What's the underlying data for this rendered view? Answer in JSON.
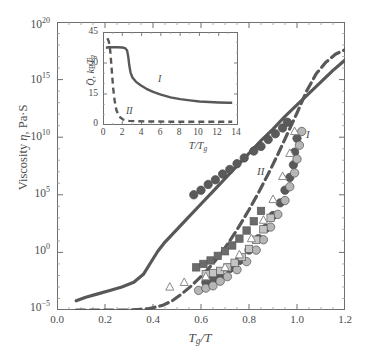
{
  "chart_data": {
    "type": "scatter",
    "title": "",
    "xlabel": "Tg/T",
    "ylabel": "Viscosity n, Pa S",
    "xlim": [
      0.0,
      1.2
    ],
    "ylim_log10": [
      -5,
      20
    ],
    "grid": false,
    "x_ticks": [
      "0.0",
      "0.2",
      "0.4",
      "0.6",
      "0.8",
      "1.0",
      "1.2"
    ],
    "x_tick_values": [
      0.0,
      0.2,
      0.4,
      0.6,
      0.8,
      1.0,
      1.2
    ],
    "y_ticks": [
      "10-5",
      "100",
      "105",
      "1010",
      "1015",
      "1020"
    ],
    "y_tick_exponents": [
      -5,
      0,
      5,
      10,
      15,
      20
    ],
    "annotations": [
      {
        "text": "I",
        "x": 1.03,
        "y_log10": 11.9
      },
      {
        "text": "II",
        "x": 0.84,
        "y_log10": 8.4
      }
    ],
    "series": [
      {
        "name": "curve-I",
        "label": "I",
        "style": "solid",
        "color": "#585858",
        "points": [
          [
            0.08,
            -4.2
          ],
          [
            0.12,
            -3.9
          ],
          [
            0.17,
            -3.6
          ],
          [
            0.22,
            -3.3
          ],
          [
            0.27,
            -3.0
          ],
          [
            0.32,
            -2.6
          ],
          [
            0.36,
            -1.9
          ],
          [
            0.39,
            -0.9
          ],
          [
            0.42,
            0.1
          ],
          [
            0.45,
            0.9
          ],
          [
            0.5,
            2.0
          ],
          [
            0.55,
            3.1
          ],
          [
            0.6,
            4.2
          ],
          [
            0.65,
            5.3
          ],
          [
            0.7,
            6.4
          ],
          [
            0.75,
            7.5
          ],
          [
            0.8,
            8.6
          ],
          [
            0.85,
            9.7
          ],
          [
            0.9,
            10.7
          ],
          [
            0.95,
            11.8
          ],
          [
            1.0,
            12.8
          ],
          [
            1.05,
            13.8
          ],
          [
            1.1,
            14.8
          ],
          [
            1.15,
            15.8
          ],
          [
            1.2,
            16.7
          ]
        ]
      },
      {
        "name": "curve-II",
        "label": "II",
        "style": "dashed",
        "color": "#585858",
        "points": [
          [
            0.08,
            -5.0
          ],
          [
            0.15,
            -5.0
          ],
          [
            0.22,
            -5.0
          ],
          [
            0.3,
            -5.0
          ],
          [
            0.38,
            -4.9
          ],
          [
            0.44,
            -4.6
          ],
          [
            0.48,
            -4.2
          ],
          [
            0.52,
            -3.6
          ],
          [
            0.56,
            -2.9
          ],
          [
            0.6,
            -2.1
          ],
          [
            0.64,
            -1.2
          ],
          [
            0.68,
            -0.2
          ],
          [
            0.72,
            1.0
          ],
          [
            0.76,
            2.3
          ],
          [
            0.8,
            3.7
          ],
          [
            0.84,
            5.2
          ],
          [
            0.88,
            6.8
          ],
          [
            0.92,
            8.5
          ],
          [
            0.96,
            10.3
          ],
          [
            1.0,
            12.1
          ],
          [
            1.04,
            14.0
          ],
          [
            1.08,
            15.5
          ],
          [
            1.12,
            16.5
          ],
          [
            1.16,
            17.2
          ],
          [
            1.2,
            17.6
          ]
        ]
      },
      {
        "name": "dark-circles-upper",
        "marker": "circle",
        "fill": "#5a5a5a",
        "points": [
          [
            0.57,
            5.0
          ],
          [
            0.6,
            5.4
          ],
          [
            0.63,
            5.9
          ],
          [
            0.66,
            6.3
          ],
          [
            0.69,
            6.8
          ],
          [
            0.72,
            7.2
          ],
          [
            0.75,
            7.7
          ],
          [
            0.78,
            8.2
          ],
          [
            0.82,
            8.8
          ],
          [
            0.85,
            9.2
          ],
          [
            0.88,
            9.8
          ],
          [
            0.91,
            10.3
          ],
          [
            0.94,
            10.8
          ],
          [
            0.96,
            11.3
          ]
        ]
      },
      {
        "name": "dark-circles-lower",
        "marker": "circle",
        "fill": "#5a5a5a",
        "points": [
          [
            0.62,
            -2.6
          ],
          [
            0.65,
            -2.3
          ],
          [
            0.68,
            -2.0
          ],
          [
            0.72,
            -1.4
          ],
          [
            0.76,
            -0.7
          ],
          [
            0.8,
            0.2
          ],
          [
            0.84,
            1.2
          ],
          [
            0.87,
            2.1
          ],
          [
            0.9,
            3.2
          ],
          [
            0.93,
            4.3
          ],
          [
            0.95,
            5.4
          ],
          [
            0.97,
            6.5
          ],
          [
            0.985,
            7.6
          ],
          [
            0.99,
            8.7
          ],
          [
            1.0,
            9.9
          ]
        ]
      },
      {
        "name": "light-circles",
        "marker": "circle",
        "fill": "#b6b6b6",
        "points": [
          [
            0.59,
            -3.3
          ],
          [
            0.62,
            -3.1
          ],
          [
            0.65,
            -2.9
          ],
          [
            0.68,
            -2.5
          ],
          [
            0.71,
            -2.1
          ],
          [
            0.75,
            -1.5
          ],
          [
            0.79,
            -0.8
          ],
          [
            0.83,
            0.2
          ],
          [
            0.86,
            1.1
          ],
          [
            0.89,
            2.2
          ],
          [
            0.92,
            3.3
          ],
          [
            0.95,
            4.5
          ],
          [
            0.97,
            5.7
          ],
          [
            0.99,
            6.9
          ],
          [
            1.0,
            8.1
          ],
          [
            1.01,
            9.3
          ],
          [
            1.02,
            10.5
          ]
        ]
      },
      {
        "name": "dark-squares",
        "marker": "square",
        "fill": "#6b6b6b",
        "points": [
          [
            0.58,
            -1.3
          ],
          [
            0.61,
            -1.0
          ],
          [
            0.64,
            -0.7
          ],
          [
            0.67,
            -0.3
          ],
          [
            0.7,
            0.1
          ],
          [
            0.73,
            0.6
          ],
          [
            0.76,
            1.2
          ],
          [
            0.79,
            1.9
          ],
          [
            0.82,
            2.7
          ],
          [
            0.85,
            3.6
          ]
        ]
      },
      {
        "name": "light-squares",
        "marker": "square",
        "fill": "#c4c4c4",
        "points": [
          [
            0.62,
            -1.9
          ],
          [
            0.65,
            -1.8
          ],
          [
            0.68,
            -1.6
          ],
          [
            0.71,
            -1.3
          ],
          [
            0.74,
            -0.9
          ],
          [
            0.77,
            -0.4
          ],
          [
            0.8,
            0.3
          ],
          [
            0.83,
            1.1
          ],
          [
            0.86,
            2.0
          ],
          [
            0.89,
            3.0
          ]
        ]
      },
      {
        "name": "open-triangles",
        "marker": "triangle",
        "fill": "#ffffff",
        "stroke": "#8a8a8a",
        "points": [
          [
            0.47,
            -3.0
          ],
          [
            0.53,
            -2.6
          ],
          [
            0.62,
            -2.1
          ],
          [
            0.7,
            -1.3
          ],
          [
            0.76,
            -0.2
          ],
          [
            0.81,
            1.2
          ],
          [
            0.86,
            2.8
          ],
          [
            0.9,
            4.6
          ],
          [
            0.94,
            6.6
          ],
          [
            0.97,
            8.6
          ],
          [
            0.99,
            10.5
          ]
        ]
      }
    ]
  },
  "inset": {
    "chart_data": {
      "type": "line",
      "xlabel": "T/Tg",
      "ylabel": "Q, kB Tg",
      "xlim": [
        0,
        14
      ],
      "ylim": [
        0,
        45
      ],
      "grid": false,
      "x_ticks": [
        "0",
        "2",
        "4",
        "6",
        "8",
        "10",
        "12",
        "14"
      ],
      "x_tick_values": [
        0,
        2,
        4,
        6,
        8,
        10,
        12,
        14
      ],
      "y_ticks": [
        "0",
        "15",
        "30",
        "45"
      ],
      "y_tick_values": [
        0,
        15,
        30,
        45
      ],
      "annotations": [
        {
          "text": "I",
          "x": 5.4,
          "y": 20.0
        },
        {
          "text": "II",
          "x": 2.9,
          "y": 4.6
        }
      ],
      "series": [
        {
          "name": "inset-curve-I",
          "label": "I",
          "style": "solid",
          "color": "#585858",
          "points": [
            [
              0.3,
              37.4
            ],
            [
              0.6,
              37.6
            ],
            [
              1.0,
              37.6
            ],
            [
              1.5,
              37.6
            ],
            [
              2.0,
              37.5
            ],
            [
              2.3,
              37.2
            ],
            [
              2.5,
              36.0
            ],
            [
              2.62,
              33.0
            ],
            [
              2.72,
              29.0
            ],
            [
              2.85,
              25.5
            ],
            [
              3.05,
              23.0
            ],
            [
              3.4,
              21.0
            ],
            [
              3.9,
              19.2
            ],
            [
              4.5,
              17.5
            ],
            [
              5.2,
              16.0
            ],
            [
              6.0,
              14.7
            ],
            [
              7.0,
              13.4
            ],
            [
              8.0,
              12.5
            ],
            [
              9.0,
              11.9
            ],
            [
              10.0,
              11.4
            ],
            [
              11.0,
              11.1
            ],
            [
              12.0,
              10.9
            ],
            [
              13.0,
              10.8
            ],
            [
              13.4,
              10.8
            ]
          ]
        },
        {
          "name": "inset-curve-II",
          "label": "II",
          "style": "dashed",
          "color": "#585858",
          "points": [
            [
              0.45,
              42.0
            ],
            [
              0.6,
              40.5
            ],
            [
              0.75,
              36.0
            ],
            [
              0.85,
              30.0
            ],
            [
              0.95,
              24.0
            ],
            [
              1.05,
              18.0
            ],
            [
              1.2,
              12.0
            ],
            [
              1.4,
              7.0
            ],
            [
              1.7,
              4.0
            ],
            [
              2.1,
              2.6
            ],
            [
              2.7,
              2.0
            ],
            [
              3.5,
              1.8
            ],
            [
              5.0,
              1.7
            ],
            [
              7.0,
              1.6
            ],
            [
              9.0,
              1.6
            ],
            [
              11.0,
              1.6
            ],
            [
              13.0,
              1.6
            ],
            [
              13.4,
              1.6
            ]
          ]
        }
      ]
    }
  }
}
